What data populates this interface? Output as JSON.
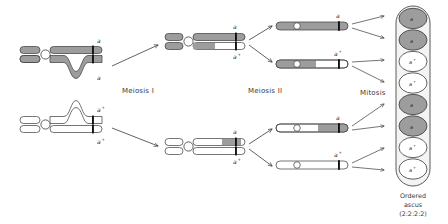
{
  "figure": {
    "title_visible": false,
    "stage_labels": [
      {
        "id": "meiosis-1",
        "text": "Meiosis I",
        "x": 122,
        "y": 93
      },
      {
        "id": "meiosis-2",
        "text": "Meiosis II",
        "x": 248,
        "y": 93
      },
      {
        "id": "mitosis",
        "text": "Mitosis",
        "x": 362,
        "y": 95
      }
    ],
    "caption": {
      "line1": "Ordered",
      "line2": "ascus",
      "line3": "(2:2:2:2)"
    },
    "colors": {
      "gray_fill": "#9d9d9d",
      "gray_fill_light": "#b4b4b4",
      "white_fill": "#ffffff",
      "outline": "#3a3a3a",
      "centromere": "#ffffff",
      "band": "#111111",
      "arrow": "#3a3a3a",
      "ascus_wall": "#5a5a5a",
      "text": "#2a2a2a"
    },
    "allele_labels": {
      "mutant": "a",
      "wild": "a",
      "wild_superscript": "+"
    },
    "bivalents": [
      {
        "id": "bivalent-upper",
        "name": "mutant-homolog-pair-with-crossover",
        "shading": "gray",
        "labels": [
          {
            "id": "upper-chromatid-label",
            "text": "a",
            "sup": ""
          },
          {
            "id": "lower-chromatid-label",
            "text": "a",
            "sup": ""
          }
        ]
      },
      {
        "id": "bivalent-lower",
        "name": "wildtype-homolog-pair-with-crossover",
        "shading": "white",
        "labels": [
          {
            "id": "upper-chromatid-label",
            "text": "a",
            "sup": "+"
          },
          {
            "id": "lower-chromatid-label",
            "text": "a",
            "sup": "+"
          }
        ]
      }
    ],
    "meiosis1_products": [
      {
        "id": "mi-product-top",
        "name": "meiosis1-product-top",
        "chromatids": [
          {
            "id": "top",
            "fill": "gray",
            "distal_fill": "gray",
            "label": "a",
            "sup": ""
          },
          {
            "id": "bottom",
            "fill": "gray",
            "distal_fill": "white",
            "label": "a",
            "sup": "+"
          }
        ]
      },
      {
        "id": "mi-product-bottom",
        "name": "meiosis1-product-bottom",
        "chromatids": [
          {
            "id": "top",
            "fill": "white",
            "distal_fill": "gray",
            "label": "a",
            "sup": ""
          },
          {
            "id": "bottom",
            "fill": "white",
            "distal_fill": "white",
            "label": "a",
            "sup": "+"
          }
        ]
      }
    ],
    "meiosis2_products": [
      {
        "id": "mii-1",
        "name": "meiosis2-product-1",
        "proximal": "gray",
        "distal": "gray",
        "label": "a",
        "sup": ""
      },
      {
        "id": "mii-2",
        "name": "meiosis2-product-2",
        "proximal": "gray",
        "distal": "white",
        "label": "a",
        "sup": "+"
      },
      {
        "id": "mii-3",
        "name": "meiosis2-product-3",
        "proximal": "white",
        "distal": "gray",
        "label": "a",
        "sup": ""
      },
      {
        "id": "mii-4",
        "name": "meiosis2-product-4",
        "proximal": "white",
        "distal": "white",
        "label": "a",
        "sup": "+"
      }
    ],
    "ascospores": [
      {
        "index": 1,
        "id": "ascospore-1",
        "genotype": "a",
        "sup": "",
        "fill": "gray"
      },
      {
        "index": 2,
        "id": "ascospore-2",
        "genotype": "a",
        "sup": "",
        "fill": "gray"
      },
      {
        "index": 3,
        "id": "ascospore-3",
        "genotype": "a",
        "sup": "+",
        "fill": "white"
      },
      {
        "index": 4,
        "id": "ascospore-4",
        "genotype": "a",
        "sup": "+",
        "fill": "white"
      },
      {
        "index": 5,
        "id": "ascospore-5",
        "genotype": "a",
        "sup": "",
        "fill": "gray"
      },
      {
        "index": 6,
        "id": "ascospore-6",
        "genotype": "a",
        "sup": "",
        "fill": "gray"
      },
      {
        "index": 7,
        "id": "ascospore-7",
        "genotype": "a",
        "sup": "+",
        "fill": "white"
      },
      {
        "index": 8,
        "id": "ascospore-8",
        "genotype": "a",
        "sup": "+",
        "fill": "white"
      }
    ]
  }
}
